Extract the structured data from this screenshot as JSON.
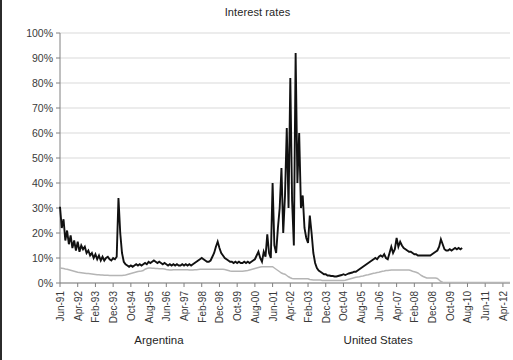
{
  "chart_data": {
    "type": "line",
    "title": "Interest rates",
    "xlabel": "",
    "ylabel": "",
    "ylim": [
      0,
      100
    ],
    "ytick_labels": [
      "0%",
      "10%",
      "20%",
      "30%",
      "40%",
      "50%",
      "60%",
      "70%",
      "80%",
      "90%",
      "100%"
    ],
    "ytick_values": [
      0,
      10,
      20,
      30,
      40,
      50,
      60,
      70,
      80,
      90,
      100
    ],
    "grid": true,
    "legend_position": "bottom",
    "x_start": "Jun-91",
    "x_end": "Jun-12",
    "xtick_labels": [
      "Jun-91",
      "Apr-92",
      "Feb-93",
      "Dec-93",
      "Oct-94",
      "Aug-95",
      "Jun-96",
      "Apr-97",
      "Feb-98",
      "Dec-98",
      "Oct-99",
      "Aug-00",
      "Jun-01",
      "Apr-02",
      "Feb-03",
      "Dec-03",
      "Oct-04",
      "Aug-05",
      "Jun-06",
      "Apr-07",
      "Feb-08",
      "Dec-08",
      "Oct-09",
      "Aug-10",
      "Jun-11",
      "Apr-12"
    ],
    "xtick_interval_months": 10,
    "series": [
      {
        "name": "Argentina",
        "color": "#111111",
        "width": 1.9,
        "values": [
          30.5,
          22.0,
          25.5,
          17.0,
          21.0,
          15.5,
          19.0,
          14.0,
          17.0,
          13.0,
          16.5,
          12.5,
          15.0,
          13.5,
          14.5,
          12.0,
          13.0,
          11.0,
          12.0,
          10.0,
          11.5,
          9.5,
          11.0,
          9.0,
          10.5,
          9.0,
          10.0,
          10.5,
          9.5,
          9.0,
          10.0,
          9.5,
          10.5,
          34.0,
          20.0,
          12.0,
          8.5,
          7.5,
          7.0,
          6.5,
          7.0,
          6.5,
          7.0,
          7.5,
          7.0,
          7.5,
          7.0,
          7.5,
          8.0,
          7.5,
          8.5,
          8.0,
          8.5,
          9.0,
          8.5,
          8.0,
          8.5,
          8.0,
          7.5,
          8.0,
          7.5,
          7.0,
          7.5,
          7.0,
          7.5,
          7.0,
          7.5,
          7.0,
          7.0,
          7.5,
          7.0,
          7.5,
          7.0,
          7.5,
          7.0,
          7.5,
          8.0,
          8.5,
          9.0,
          9.5,
          10.0,
          9.5,
          9.0,
          8.5,
          8.5,
          9.0,
          10.5,
          12.0,
          14.5,
          16.5,
          14.0,
          12.0,
          11.0,
          10.0,
          9.5,
          9.0,
          8.5,
          8.5,
          8.0,
          8.5,
          8.0,
          8.5,
          8.0,
          8.0,
          8.5,
          8.0,
          8.5,
          8.0,
          8.5,
          9.0,
          9.5,
          11.0,
          12.5,
          10.0,
          8.5,
          12.5,
          10.5,
          19.5,
          12.0,
          10.0,
          40.0,
          15.0,
          12.0,
          22.0,
          30.0,
          46.0,
          20.0,
          35.0,
          62.0,
          30.0,
          82.0,
          33.0,
          15.0,
          92.0,
          40.0,
          60.0,
          30.0,
          35.0,
          22.0,
          18.0,
          16.0,
          27.0,
          20.0,
          12.0,
          8.0,
          6.0,
          5.0,
          4.5,
          4.0,
          3.5,
          3.5,
          3.0,
          3.0,
          2.8,
          2.8,
          2.6,
          2.6,
          2.8,
          3.0,
          3.2,
          3.5,
          3.2,
          3.5,
          3.8,
          4.0,
          4.2,
          4.5,
          4.5,
          5.0,
          5.5,
          6.0,
          6.5,
          7.0,
          7.5,
          8.0,
          8.5,
          9.0,
          9.5,
          10.0,
          9.5,
          10.5,
          11.0,
          10.5,
          11.5,
          10.0,
          9.5,
          12.0,
          14.5,
          12.0,
          13.5,
          18.0,
          14.5,
          16.5,
          15.0,
          14.0,
          13.5,
          13.0,
          12.5,
          12.5,
          12.0,
          11.5,
          11.5,
          11.0,
          11.0,
          11.0,
          11.0,
          11.0,
          11.0,
          11.0,
          11.0,
          11.5,
          12.0,
          12.5,
          13.0,
          14.5,
          17.5,
          15.5,
          13.5,
          13.0,
          13.0,
          13.5,
          13.0,
          13.5,
          14.0,
          13.5,
          14.0,
          13.5,
          14.0
        ]
      },
      {
        "name": "United States",
        "color": "#b5b5b5",
        "width": 1.5,
        "values": [
          6.0,
          5.9,
          5.8,
          5.6,
          5.5,
          5.3,
          5.1,
          4.9,
          4.7,
          4.5,
          4.3,
          4.2,
          4.1,
          4.0,
          3.9,
          3.8,
          3.8,
          3.7,
          3.6,
          3.5,
          3.4,
          3.3,
          3.3,
          3.2,
          3.2,
          3.1,
          3.1,
          3.1,
          3.0,
          3.0,
          3.0,
          3.0,
          3.0,
          3.0,
          3.0,
          3.0,
          3.1,
          3.2,
          3.4,
          3.6,
          3.8,
          4.0,
          4.2,
          4.4,
          4.6,
          4.7,
          4.8,
          5.0,
          5.5,
          5.8,
          6.0,
          6.0,
          5.9,
          5.9,
          5.8,
          5.8,
          5.7,
          5.7,
          5.7,
          5.6,
          5.4,
          5.3,
          5.2,
          5.2,
          5.3,
          5.3,
          5.3,
          5.3,
          5.3,
          5.3,
          5.3,
          5.3,
          5.3,
          5.2,
          5.2,
          5.2,
          5.3,
          5.3,
          5.4,
          5.5,
          5.5,
          5.5,
          5.5,
          5.5,
          5.5,
          5.5,
          5.5,
          5.5,
          5.5,
          5.5,
          5.5,
          5.5,
          5.5,
          5.4,
          5.2,
          5.0,
          4.8,
          4.7,
          4.7,
          4.7,
          4.7,
          4.7,
          4.7,
          4.7,
          4.8,
          4.9,
          5.0,
          5.2,
          5.4,
          5.6,
          5.8,
          6.0,
          6.2,
          6.4,
          6.5,
          6.5,
          6.5,
          6.5,
          6.5,
          6.5,
          6.5,
          6.0,
          5.5,
          5.0,
          4.5,
          4.0,
          3.7,
          3.5,
          3.0,
          2.5,
          2.1,
          1.8,
          1.7,
          1.7,
          1.7,
          1.7,
          1.7,
          1.7,
          1.7,
          1.7,
          1.7,
          1.4,
          1.3,
          1.2,
          1.2,
          1.2,
          1.2,
          1.2,
          1.0,
          1.0,
          1.0,
          1.0,
          1.0,
          1.0,
          1.0,
          1.0,
          1.0,
          1.0,
          1.0,
          1.0,
          1.0,
          1.1,
          1.3,
          1.5,
          1.7,
          1.9,
          2.1,
          2.3,
          2.4,
          2.5,
          2.7,
          2.8,
          3.0,
          3.2,
          3.3,
          3.5,
          3.7,
          3.9,
          4.0,
          4.2,
          4.3,
          4.5,
          4.7,
          4.8,
          5.0,
          5.0,
          5.1,
          5.2,
          5.2,
          5.2,
          5.2,
          5.2,
          5.2,
          5.2,
          5.2,
          5.2,
          5.2,
          5.2,
          5.0,
          4.7,
          4.5,
          4.3,
          4.0,
          3.5,
          3.0,
          2.6,
          2.3,
          2.0,
          2.0,
          2.0,
          2.0,
          2.0,
          2.0,
          1.8,
          1.2,
          0.6,
          0.3,
          0.2,
          0.2,
          0.2,
          0.2,
          0.2,
          0.2,
          0.2,
          0.2,
          0.2,
          0.2,
          0.2,
          0.2,
          0.2,
          0.2,
          0.2,
          0.2,
          0.2,
          0.2,
          0.2,
          0.2,
          0.2,
          0.2,
          0.2,
          0.2,
          0.2,
          0.2,
          0.2,
          0.2,
          0.2,
          0.2,
          0.2,
          0.2,
          0.2,
          0.2,
          0.2,
          0.2,
          0.2,
          0.2
        ]
      }
    ]
  },
  "legend": {
    "entries": [
      {
        "label": "Argentina",
        "color": "#111111",
        "width": 3
      },
      {
        "label": "United States",
        "color": "#b5b5b5",
        "width": 2
      }
    ]
  }
}
